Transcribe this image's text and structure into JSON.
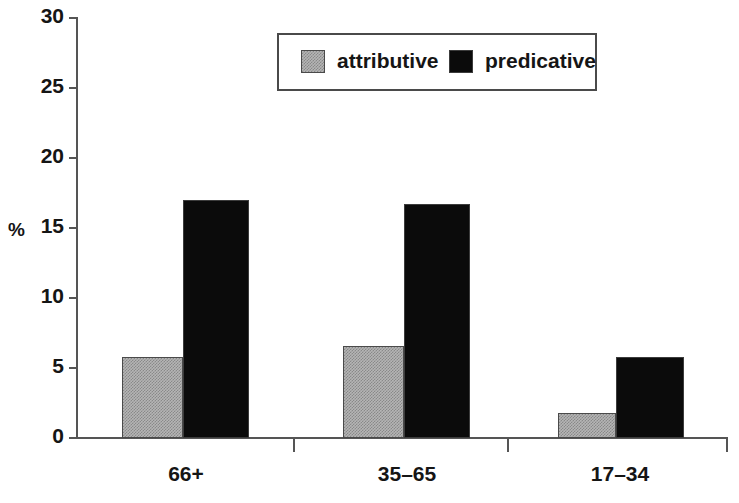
{
  "chart_data": {
    "type": "bar",
    "title": "",
    "subtitle": "",
    "xlabel": "",
    "ylabel": "%",
    "categories": [
      "66+",
      "35–65",
      "17–34"
    ],
    "series": [
      {
        "name": "attributive",
        "color": "#b5b5b5",
        "values": [
          5.8,
          6.6,
          1.8
        ]
      },
      {
        "name": "predicative",
        "color": "#000000",
        "values": [
          17.0,
          16.7,
          5.8
        ]
      }
    ],
    "ylim": [
      0,
      30
    ],
    "yticks": [
      0,
      5,
      10,
      15,
      20,
      25,
      30
    ],
    "ytick_labels": [
      "0",
      "5",
      "10",
      "15",
      "20",
      "25",
      "30"
    ],
    "grid": false,
    "legend_position": "top-center",
    "legend_entries": [
      "attributive",
      "predicative"
    ],
    "annotations": []
  },
  "axes": {
    "y_axis_title": "%",
    "axis_color": "#555555"
  }
}
